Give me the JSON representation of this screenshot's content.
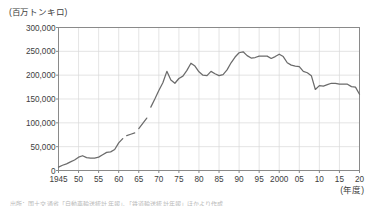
{
  "chart_data": {
    "type": "line",
    "title": "",
    "subtitle": "",
    "ylabel": "(百万トンキロ)",
    "xlabel": "(年度)",
    "ylim": [
      0,
      300000
    ],
    "xlim": [
      1945,
      2020
    ],
    "grid": true,
    "legend": null,
    "ytick_labels": [
      "300,000",
      "250,000",
      "200,000",
      "150,000",
      "100,000",
      "50,000",
      "0"
    ],
    "ytick_values": [
      300000,
      250000,
      200000,
      150000,
      100000,
      50000,
      0
    ],
    "xtick_labels": [
      "1945",
      "50",
      "55",
      "60",
      "65",
      "70",
      "75",
      "80",
      "85",
      "90",
      "95",
      "2000",
      "05",
      "10",
      "15",
      "20"
    ],
    "xtick_values": [
      1945,
      1950,
      1955,
      1960,
      1965,
      1970,
      1975,
      1980,
      1985,
      1990,
      1995,
      2000,
      2005,
      2010,
      2015,
      2020
    ],
    "line_color": "#6b6b6b",
    "grid_color": "#d8d8d8",
    "axis_color": "#8a8a8a",
    "series": [
      {
        "name": "貨物輸送量",
        "segments": [
          {
            "x": [
              1945,
              1946,
              1947,
              1948,
              1949,
              1950,
              1951,
              1952,
              1953,
              1954,
              1955,
              1956,
              1957,
              1958,
              1959,
              1960,
              1961
            ],
            "y": [
              7000,
              11000,
              14000,
              18000,
              22000,
              28000,
              31000,
              27000,
              26000,
              26000,
              28000,
              33000,
              38000,
              39000,
              44000,
              58000,
              67000
            ]
          },
          {
            "x": [
              1962,
              1963,
              1964
            ],
            "y": [
              73000,
              76000,
              79000
            ]
          },
          {
            "x": [
              1965,
              1966,
              1967
            ],
            "y": [
              88000,
              99000,
              110000
            ]
          },
          {
            "x": [
              1968,
              1969,
              1970,
              1971,
              1972,
              1973,
              1974,
              1975,
              1976,
              1977,
              1978,
              1979,
              1980,
              1981,
              1982,
              1983,
              1984,
              1985,
              1986,
              1987,
              1988,
              1989,
              1990,
              1991,
              1992,
              1993,
              1994,
              1995,
              1996,
              1997,
              1998,
              1999,
              2000,
              2001,
              2002,
              2003,
              2004,
              2005,
              2006,
              2007,
              2008,
              2009,
              2010,
              2011,
              2012,
              2013,
              2014,
              2015,
              2016,
              2017,
              2018,
              2019,
              2020
            ],
            "y": [
              133000,
              150000,
              168000,
              184000,
              208000,
              190000,
              183000,
              193000,
              198000,
              210000,
              225000,
              219000,
              207000,
              200000,
              199000,
              208000,
              203000,
              199000,
              201000,
              211000,
              226000,
              238000,
              247000,
              249000,
              241000,
              236000,
              237000,
              240000,
              240000,
              240000,
              235000,
              239000,
              244000,
              239000,
              226000,
              221000,
              219000,
              218000,
              208000,
              205000,
              199000,
              170000,
              178000,
              177000,
              180000,
              183000,
              183000,
              181000,
              181000,
              181000,
              176000,
              175000,
              160000
            ]
          }
        ]
      }
    ]
  },
  "footnote": {
    "text": "出所：国土交通省「自動車輸送統計年報」、「鉄道輸送統計年報」ほかより作成"
  }
}
